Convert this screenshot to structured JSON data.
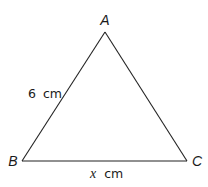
{
  "diagram": {
    "type": "triangle",
    "vertices": {
      "A": {
        "label": "A",
        "x": 105,
        "y": 32
      },
      "B": {
        "label": "B",
        "x": 22,
        "y": 161
      },
      "C": {
        "label": "C",
        "x": 187,
        "y": 161
      }
    },
    "sides": {
      "AB": {
        "label": "6 cm",
        "value": "6",
        "unit": "cm"
      },
      "BC": {
        "label": "x cm",
        "variable": "x",
        "unit": "cm"
      }
    },
    "colors": {
      "stroke": "#222222",
      "text": "#1a1a1a",
      "background": "#ffffff"
    }
  }
}
